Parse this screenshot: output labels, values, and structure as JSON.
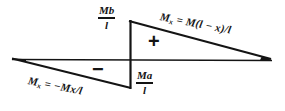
{
  "diagram": {
    "ink_color": "#141414",
    "background": "#ffffff",
    "labels": {
      "moment_top": {
        "numerator": "Mb",
        "denominator": "l"
      },
      "moment_bottom": {
        "numerator": "Ma",
        "denominator": "l"
      }
    },
    "equations": {
      "right": {
        "lhs": "M",
        "subscript": "x",
        "relation": "=",
        "rhs": "M(l − x)/l",
        "full": "Mₓ = M(l − x)/l"
      },
      "left": {
        "lhs": "M",
        "subscript": "x",
        "relation": "=",
        "rhs": "−Mx/l",
        "full": "Mₓ = −Mx/l"
      }
    },
    "signs": {
      "positive": "+",
      "negative": "−"
    },
    "geometry": {
      "baseline": {
        "x1": 12,
        "y1": 59,
        "x2": 272,
        "y2": 60
      },
      "divider": {
        "x": 130,
        "y_top": 21,
        "y_bottom": 88
      },
      "upper_triangle": {
        "apex_x": 130,
        "apex_y": 21,
        "tip_x": 270,
        "tip_y": 60
      },
      "lower_triangle": {
        "apex_x": 130,
        "apex_y": 88,
        "tip_x": 13,
        "tip_y": 59
      }
    }
  }
}
